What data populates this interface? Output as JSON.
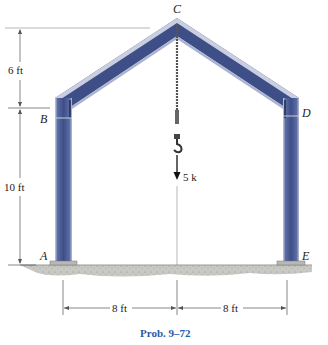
{
  "figure": {
    "caption": "Prob. 9–72",
    "points": {
      "A": "A",
      "B": "B",
      "C": "C",
      "D": "D",
      "E": "E"
    },
    "dimensions": {
      "height_upper": "6 ft",
      "height_lower": "10 ft",
      "span_left": "8 ft",
      "span_right": "8 ft"
    },
    "load": {
      "label": "5 k",
      "direction": "down"
    },
    "colors": {
      "steel": "#3d4f86",
      "steel_light": "#6f80b4",
      "steel_edge": "#c9cfe0",
      "ground": "#c8c8c4",
      "caption": "#2a5aa8",
      "dim_line": "#555555"
    }
  }
}
